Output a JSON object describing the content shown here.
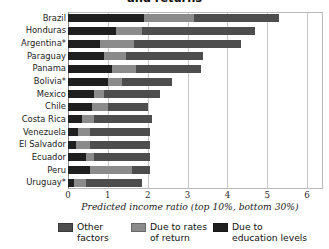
{
  "chart_data": {
    "type": "bar",
    "orientation": "horizontal",
    "stacked": true,
    "title": "and returns",
    "xlabel": "Predicted income ratio (top 10%, bottom 30%)",
    "ylabel": "",
    "xlim": [
      0,
      6.4
    ],
    "xticks": [
      0,
      1,
      2,
      3,
      4,
      5,
      6
    ],
    "xticklabels": [
      "0",
      "1",
      "2",
      "3",
      "4",
      "5",
      "6"
    ],
    "grid": "vertical",
    "legend_position": "bottom",
    "categories": [
      "Brazil",
      "Honduras",
      "Argentina*",
      "Paraguay",
      "Panama",
      "Bolivia*",
      "Mexico",
      "Chile",
      "Costa Rica",
      "Venezuela",
      "El Salvador",
      "Ecuador",
      "Peru",
      "Uruguay*"
    ],
    "series": [
      {
        "name": "Due to education levels",
        "color": "#1f1f1f",
        "values": [
          1.9,
          1.2,
          0.8,
          0.9,
          1.1,
          1.0,
          0.65,
          0.6,
          0.35,
          0.25,
          0.2,
          0.45,
          0.55,
          0.15
        ]
      },
      {
        "name": "Due to rates of return",
        "color": "#8b8b8b",
        "values": [
          1.25,
          0.65,
          0.85,
          0.55,
          0.6,
          0.35,
          0.25,
          0.4,
          0.3,
          0.3,
          0.35,
          0.2,
          1.05,
          0.3
        ]
      },
      {
        "name": "Other factors",
        "color": "#4d4d4d",
        "values": [
          2.15,
          2.85,
          2.7,
          1.95,
          1.65,
          1.25,
          1.4,
          1.0,
          1.45,
          1.5,
          1.5,
          1.4,
          0.45,
          1.4
        ]
      }
    ],
    "totals": [
      5.3,
      4.7,
      4.35,
      3.4,
      3.35,
      2.6,
      2.3,
      2.0,
      2.1,
      2.05,
      2.05,
      2.05,
      2.05,
      1.85
    ]
  },
  "legend": {
    "items": [
      {
        "label": "Other\nfactors",
        "color": "#4d4d4d",
        "swatch_name": "legend-swatch-other-factors"
      },
      {
        "label": "Due to rates\nof return",
        "color": "#8b8b8b",
        "swatch_name": "legend-swatch-rates-of-return"
      },
      {
        "label": "Due to\neducation levels",
        "color": "#1f1f1f",
        "swatch_name": "legend-swatch-education-levels"
      }
    ]
  }
}
